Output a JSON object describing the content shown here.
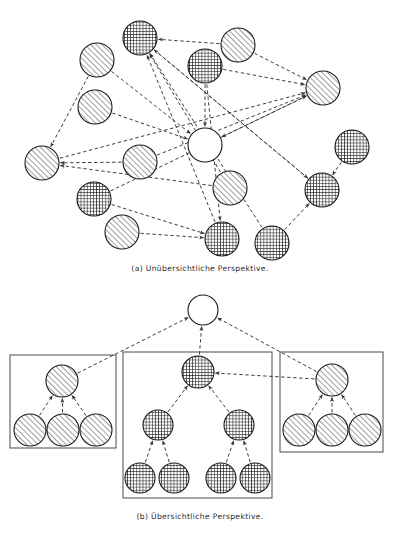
{
  "figure": {
    "kind": "two-panel-diagram",
    "background_color": "#ffffff",
    "line_color": "#333333",
    "node_stroke": "#1a1a1a",
    "hatch_color": "#555555",
    "grid_color": "#222222"
  },
  "captions": {
    "a": "(a)  Unübersichtliche Perspektive.",
    "b": "(b)  Übersichtliche Perspektive."
  },
  "panel_a": {
    "label": "Unübersichtliche Perspektive",
    "node_radius": 17,
    "nodes": [
      {
        "id": "a1",
        "name": "grid-node-top",
        "x": 140,
        "y": 38,
        "fill": "grid"
      },
      {
        "id": "a2",
        "name": "hatch-node-upper-left",
        "x": 97,
        "y": 60,
        "fill": "hatch"
      },
      {
        "id": "a3",
        "name": "hatch-node-top-right",
        "x": 238,
        "y": 45,
        "fill": "hatch"
      },
      {
        "id": "a4",
        "name": "grid-node-upper-mid",
        "x": 205,
        "y": 66,
        "fill": "grid"
      },
      {
        "id": "a5",
        "name": "hatch-node-far-right",
        "x": 323,
        "y": 88,
        "fill": "hatch"
      },
      {
        "id": "a6",
        "name": "hatch-node-left-mid",
        "x": 95,
        "y": 107,
        "fill": "hatch"
      },
      {
        "id": "a7",
        "name": "empty-node-center",
        "x": 205,
        "y": 145,
        "fill": "empty"
      },
      {
        "id": "a8",
        "name": "hatch-node-left-low",
        "x": 42,
        "y": 163,
        "fill": "hatch"
      },
      {
        "id": "a9",
        "name": "hatch-node-mid-low",
        "x": 140,
        "y": 162,
        "fill": "hatch"
      },
      {
        "id": "a10",
        "name": "grid-node-right-high",
        "x": 352,
        "y": 147,
        "fill": "grid"
      },
      {
        "id": "a11",
        "name": "hatch-node-center-low",
        "x": 230,
        "y": 188,
        "fill": "hatch"
      },
      {
        "id": "a12",
        "name": "grid-node-right-mid",
        "x": 322,
        "y": 190,
        "fill": "grid"
      },
      {
        "id": "a13",
        "name": "grid-node-bottom-left",
        "x": 94,
        "y": 199,
        "fill": "grid"
      },
      {
        "id": "a14",
        "name": "hatch-node-bottom-left",
        "x": 122,
        "y": 232,
        "fill": "hatch"
      },
      {
        "id": "a15",
        "name": "grid-node-bottom-mid",
        "x": 222,
        "y": 239,
        "fill": "grid"
      },
      {
        "id": "a16",
        "name": "grid-node-bottom-right",
        "x": 272,
        "y": 243,
        "fill": "grid"
      }
    ],
    "edges": [
      {
        "from": "a3",
        "to": "a1"
      },
      {
        "from": "a2",
        "to": "a8"
      },
      {
        "from": "a6",
        "to": "a7"
      },
      {
        "from": "a3",
        "to": "a5"
      },
      {
        "from": "a4",
        "to": "a5"
      },
      {
        "from": "a8",
        "to": "a5"
      },
      {
        "from": "a9",
        "to": "a5"
      },
      {
        "from": "a13",
        "to": "a5"
      },
      {
        "from": "a4",
        "to": "a7"
      },
      {
        "from": "a5",
        "to": "a7"
      },
      {
        "from": "a15",
        "to": "a1"
      },
      {
        "from": "a11",
        "to": "a1"
      },
      {
        "from": "a12",
        "to": "a1"
      },
      {
        "from": "a16",
        "to": "a1"
      },
      {
        "from": "a9",
        "to": "a8"
      },
      {
        "from": "a11",
        "to": "a8"
      },
      {
        "from": "a4",
        "to": "a15"
      },
      {
        "from": "a13",
        "to": "a15"
      },
      {
        "from": "a14",
        "to": "a15"
      },
      {
        "from": "a1",
        "to": "a12"
      },
      {
        "from": "a10",
        "to": "a12"
      },
      {
        "from": "a16",
        "to": "a12"
      },
      {
        "from": "a2",
        "to": "a7"
      }
    ]
  },
  "panel_b": {
    "label": "Übersichtliche Perspektive",
    "root": {
      "id": "root",
      "name": "empty-root-node",
      "x": 203,
      "y": 310,
      "r": 15,
      "fill": "empty"
    },
    "groups": [
      {
        "id": "group-left",
        "name": "group-box-left",
        "box": {
          "x": 10,
          "y": 355,
          "w": 106,
          "h": 93
        },
        "nodes": [
          {
            "id": "bl-parent",
            "name": "hatch-parent-left",
            "x": 62,
            "y": 381,
            "r": 16,
            "fill": "hatch"
          },
          {
            "id": "bl-c1",
            "name": "hatch-child-left-1",
            "x": 30,
            "y": 430,
            "r": 16,
            "fill": "hatch"
          },
          {
            "id": "bl-c2",
            "name": "hatch-child-left-2",
            "x": 63,
            "y": 430,
            "r": 16,
            "fill": "hatch"
          },
          {
            "id": "bl-c3",
            "name": "hatch-child-left-3",
            "x": 96,
            "y": 430,
            "r": 16,
            "fill": "hatch"
          }
        ],
        "edges": [
          {
            "from": "bl-c1",
            "to": "bl-parent"
          },
          {
            "from": "bl-c2",
            "to": "bl-parent"
          },
          {
            "from": "bl-c3",
            "to": "bl-parent"
          }
        ],
        "root_edge_from": "bl-parent"
      },
      {
        "id": "group-middle",
        "name": "group-box-middle",
        "box": {
          "x": 123,
          "y": 352,
          "w": 149,
          "h": 146
        },
        "nodes": [
          {
            "id": "bm-root",
            "name": "grid-parent-middle",
            "x": 198,
            "y": 372,
            "r": 16,
            "fill": "grid"
          },
          {
            "id": "bm-l",
            "name": "grid-child-middle-left",
            "x": 158,
            "y": 425,
            "r": 15,
            "fill": "grid"
          },
          {
            "id": "bm-r",
            "name": "grid-child-middle-right",
            "x": 239,
            "y": 425,
            "r": 15,
            "fill": "grid"
          },
          {
            "id": "bm-l1",
            "name": "grid-leaf-ml-1",
            "x": 140,
            "y": 478,
            "r": 15,
            "fill": "grid"
          },
          {
            "id": "bm-l2",
            "name": "grid-leaf-ml-2",
            "x": 174,
            "y": 478,
            "r": 15,
            "fill": "grid"
          },
          {
            "id": "bm-r1",
            "name": "grid-leaf-mr-1",
            "x": 221,
            "y": 478,
            "r": 15,
            "fill": "grid"
          },
          {
            "id": "bm-r2",
            "name": "grid-leaf-mr-2",
            "x": 255,
            "y": 478,
            "r": 15,
            "fill": "grid"
          }
        ],
        "edges": [
          {
            "from": "bm-l",
            "to": "bm-root"
          },
          {
            "from": "bm-r",
            "to": "bm-root"
          },
          {
            "from": "bm-l1",
            "to": "bm-l"
          },
          {
            "from": "bm-l2",
            "to": "bm-l"
          },
          {
            "from": "bm-r1",
            "to": "bm-r"
          },
          {
            "from": "bm-r2",
            "to": "bm-r"
          }
        ],
        "root_edge_from": "bm-root"
      },
      {
        "id": "group-right",
        "name": "group-box-right",
        "box": {
          "x": 280,
          "y": 352,
          "w": 103,
          "h": 100
        },
        "nodes": [
          {
            "id": "br-parent",
            "name": "hatch-parent-right",
            "x": 332,
            "y": 380,
            "r": 16,
            "fill": "hatch"
          },
          {
            "id": "br-c1",
            "name": "hatch-child-right-1",
            "x": 299,
            "y": 430,
            "r": 16,
            "fill": "hatch"
          },
          {
            "id": "br-c2",
            "name": "hatch-child-right-2",
            "x": 332,
            "y": 430,
            "r": 16,
            "fill": "hatch"
          },
          {
            "id": "br-c3",
            "name": "hatch-child-right-3",
            "x": 365,
            "y": 430,
            "r": 16,
            "fill": "hatch"
          }
        ],
        "edges": [
          {
            "from": "br-c1",
            "to": "br-parent"
          },
          {
            "from": "br-c2",
            "to": "br-parent"
          },
          {
            "from": "br-c3",
            "to": "br-parent"
          }
        ],
        "root_edge_from": "br-parent"
      }
    ],
    "cross_group_edges": [
      {
        "from": "br-parent",
        "to": "bm-root"
      }
    ]
  }
}
